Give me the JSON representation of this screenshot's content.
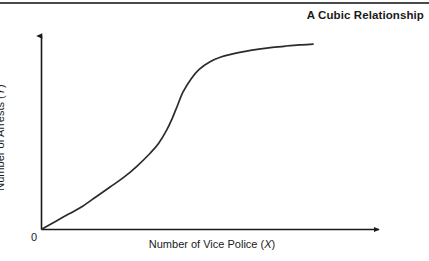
{
  "figure": {
    "title": "A Cubic Relationship",
    "background_color": "#ffffff",
    "rule_color": "#4a4a4a",
    "axis_color": "#1a1a1a",
    "curve_color": "#2b2b2b"
  },
  "axes": {
    "origin_label": "0",
    "x_label_prefix": "Number of Vice Police (",
    "x_label_symbol": "X",
    "x_label_suffix": ")",
    "y_label_prefix": "Number of Arrests (",
    "y_label_symbol": "Y",
    "y_label_suffix": ")"
  },
  "chart_data": {
    "type": "line",
    "title": "A Cubic Relationship",
    "xlabel": "Number of Vice Police (X)",
    "ylabel": "Number of Arrests (Y)",
    "grid": false,
    "legend": "none",
    "axis_arrows": true,
    "tick_labels": {
      "x": [
        "0"
      ],
      "y": []
    },
    "xlim": [
      0,
      100
    ],
    "ylim": [
      0,
      100
    ],
    "series": [
      {
        "name": "Cubic relationship",
        "description": "S-shaped cubic curve: slow rise, steep middle ascent, upper plateau",
        "x": [
          0,
          5,
          10,
          15,
          20,
          25,
          30,
          35,
          40,
          43,
          46,
          48,
          50,
          52,
          55,
          58,
          62,
          66,
          70,
          75,
          80,
          85,
          90,
          95,
          100
        ],
        "y": [
          0,
          4,
          8,
          12,
          17,
          22,
          27,
          33,
          40,
          45,
          52,
          58,
          65,
          72,
          79,
          84,
          88,
          90.5,
          92,
          93.5,
          94.7,
          95.6,
          96.3,
          96.9,
          97.3
        ]
      }
    ]
  }
}
